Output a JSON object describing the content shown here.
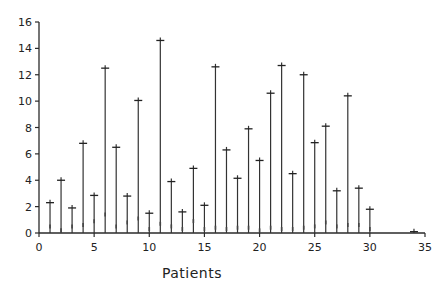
{
  "chart_data": {
    "type": "scatter",
    "style": "vertical stem (drop-line) plot with + markers at top",
    "title": "",
    "xlabel": "Patients",
    "ylabel": "",
    "xlim": [
      0,
      35
    ],
    "ylim": [
      0,
      16
    ],
    "x_ticks": [
      0,
      5,
      10,
      15,
      20,
      25,
      30,
      35
    ],
    "y_ticks": [
      0,
      2,
      4,
      6,
      8,
      10,
      12,
      14,
      16
    ],
    "grid": false,
    "legend": null,
    "x": [
      1,
      2,
      3,
      4,
      5,
      6,
      7,
      8,
      9,
      10,
      11,
      12,
      13,
      14,
      15,
      16,
      17,
      18,
      19,
      20,
      21,
      22,
      23,
      24,
      25,
      26,
      27,
      28,
      29,
      30,
      34
    ],
    "values": [
      2.3,
      4.0,
      1.9,
      6.8,
      2.85,
      12.5,
      6.5,
      2.8,
      10.05,
      1.5,
      14.6,
      3.9,
      1.6,
      4.9,
      2.1,
      12.6,
      6.3,
      4.15,
      7.9,
      5.5,
      10.6,
      12.7,
      4.5,
      12.0,
      6.85,
      8.1,
      3.2,
      10.4,
      3.4,
      1.8,
      0.1
    ],
    "low_marks": [
      0.5,
      0.2,
      0.5,
      0.6,
      0.9,
      1.4,
      0.5,
      0.8,
      1.1,
      0.3,
      0.7,
      0.5,
      0.3,
      0.9,
      0.3,
      0.4,
      0.3,
      0.4,
      0.4,
      0.2,
      0.4,
      0.3,
      0.3,
      0.4,
      0.5,
      0.8,
      0.5,
      0.6,
      0.6,
      0.3,
      0.0
    ]
  },
  "axes": {
    "x_tick_labels": [
      "0",
      "5",
      "10",
      "15",
      "20",
      "25",
      "30",
      "35"
    ],
    "y_tick_labels": [
      "0",
      "2",
      "4",
      "6",
      "8",
      "10",
      "12",
      "14",
      "16"
    ],
    "x_title": "Patients"
  },
  "colors": {
    "line": "#2a2a2a",
    "background": "#ffffff"
  }
}
